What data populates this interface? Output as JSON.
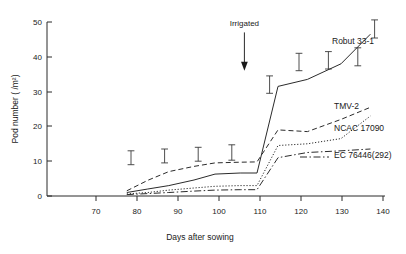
{
  "chart_data": {
    "type": "line",
    "title": "",
    "xlabel": "Days after sowing",
    "ylabel": "Pod number ( /m²)",
    "xlim": [
      60,
      143
    ],
    "ylim": [
      0,
      52
    ],
    "xticks": [
      "70",
      "80",
      "90",
      "100",
      "110",
      "120",
      "130",
      "140"
    ],
    "xtick_values": [
      70,
      80,
      90,
      100,
      110,
      120,
      130,
      140
    ],
    "yticks": [
      "0",
      "10",
      "20",
      "30",
      "40",
      "50"
    ],
    "ytick_values": [
      0,
      10,
      20,
      30,
      40,
      50
    ],
    "grid": false,
    "legend_position": "right-inline-labels",
    "annotations": [
      {
        "text": "Irrigated",
        "x": 107,
        "y": 47,
        "arrow": "down",
        "arrow_to_y": 36
      }
    ],
    "series": [
      {
        "name": "Robut 33-1",
        "linestyle": "solid",
        "x": [
          79,
          84,
          89,
          95,
          100,
          106,
          110,
          115,
          122,
          130,
          137
        ],
        "values": [
          1.0,
          2.0,
          3.0,
          4.6,
          6.3,
          6.6,
          6.6,
          31.5,
          33.5,
          38.0,
          46.5
        ]
      },
      {
        "name": "TMV-2",
        "linestyle": "dashed",
        "x": [
          79,
          84,
          89,
          95,
          100,
          106,
          110,
          115,
          122,
          130,
          137
        ],
        "values": [
          1.5,
          4.5,
          7.0,
          8.5,
          9.5,
          9.7,
          9.8,
          19.0,
          18.5,
          22.0,
          25.5
        ]
      },
      {
        "name": "NCAC 17090",
        "linestyle": "dotted",
        "x": [
          79,
          84,
          89,
          95,
          100,
          106,
          110,
          115,
          122,
          130,
          137
        ],
        "values": [
          0.6,
          1.0,
          1.7,
          2.3,
          2.8,
          3.0,
          3.0,
          14.5,
          15.0,
          16.5,
          23.0
        ]
      },
      {
        "name": "EC 76446(292)",
        "linestyle": "dashdot",
        "x": [
          79,
          84,
          89,
          95,
          100,
          106,
          110,
          115,
          122,
          130,
          137
        ],
        "values": [
          0.4,
          0.7,
          1.0,
          1.4,
          1.7,
          1.8,
          1.8,
          11.0,
          12.5,
          13.0,
          13.5
        ]
      }
    ],
    "error_bars": [
      {
        "x": 80,
        "center": 11.0,
        "half": 2.0
      },
      {
        "x": 88,
        "center": 11.5,
        "half": 2.0
      },
      {
        "x": 96,
        "center": 12.0,
        "half": 2.0
      },
      {
        "x": 104,
        "center": 12.5,
        "half": 2.2
      },
      {
        "x": 113,
        "center": 32.0,
        "half": 2.5
      },
      {
        "x": 120,
        "center": 38.5,
        "half": 2.5
      },
      {
        "x": 127,
        "center": 39.0,
        "half": 2.5
      },
      {
        "x": 134,
        "center": 40.0,
        "half": 2.6
      },
      {
        "x": 138,
        "center": 48.0,
        "half": 2.6
      }
    ],
    "series_labels": [
      {
        "name": "Robut 33-1",
        "px": 332,
        "py": 44
      },
      {
        "name": "TMV-2",
        "px": 334,
        "py": 109
      },
      {
        "name": "NCAC 17090",
        "px": 334,
        "py": 131
      },
      {
        "name": "EC 76446(292)",
        "px": 334,
        "py": 158
      }
    ]
  },
  "figure": {
    "ylabel": "Pod number ( /m²)",
    "xlabel": "Days after sowing",
    "irrigated_label": "Irrigated"
  }
}
